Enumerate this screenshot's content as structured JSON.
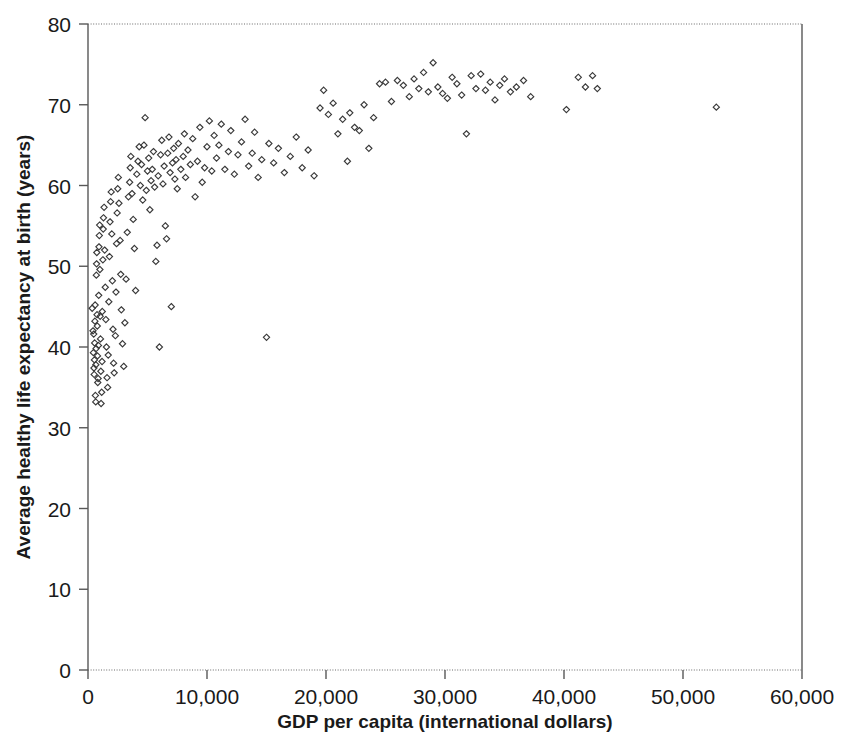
{
  "chart_data": {
    "type": "scatter",
    "title": "",
    "xlabel": "GDP per capita (international dollars)",
    "ylabel": "Average healthy life expectancy at birth (years)",
    "xlim": [
      0,
      60000
    ],
    "ylim": [
      0,
      80
    ],
    "xticks": [
      0,
      10000,
      20000,
      30000,
      40000,
      50000,
      60000
    ],
    "xtick_labels": [
      "0",
      "10,000",
      "20,000",
      "30,000",
      "40,000",
      "50,000",
      "60,000"
    ],
    "yticks": [
      0,
      10,
      20,
      30,
      40,
      50,
      60,
      70,
      80
    ],
    "ytick_labels": [
      "0",
      "10",
      "20",
      "30",
      "40",
      "50",
      "60",
      "70",
      "80"
    ],
    "grid": false,
    "legend": "none",
    "marker": "open-diamond",
    "marker_color": "#3a3a3a",
    "marker_size": 5,
    "series": [
      {
        "name": "Countries",
        "points": [
          [
            350,
            44.8
          ],
          [
            420,
            42.0
          ],
          [
            450,
            39.3
          ],
          [
            480,
            41.6
          ],
          [
            500,
            37.4
          ],
          [
            520,
            36.6
          ],
          [
            540,
            38.4
          ],
          [
            560,
            40.5
          ],
          [
            580,
            43.2
          ],
          [
            600,
            45.2
          ],
          [
            620,
            34.0
          ],
          [
            650,
            33.2
          ],
          [
            660,
            37.8
          ],
          [
            680,
            39.8
          ],
          [
            700,
            48.9
          ],
          [
            720,
            50.3
          ],
          [
            740,
            51.7
          ],
          [
            760,
            44.0
          ],
          [
            780,
            42.6
          ],
          [
            800,
            38.9
          ],
          [
            820,
            35.6
          ],
          [
            850,
            36.1
          ],
          [
            880,
            40.2
          ],
          [
            900,
            46.4
          ],
          [
            920,
            52.4
          ],
          [
            950,
            53.8
          ],
          [
            980,
            55.1
          ],
          [
            1000,
            49.6
          ],
          [
            1020,
            43.8
          ],
          [
            1050,
            41.0
          ],
          [
            1080,
            37.0
          ],
          [
            1100,
            33.0
          ],
          [
            1150,
            34.4
          ],
          [
            1180,
            38.2
          ],
          [
            1200,
            44.4
          ],
          [
            1250,
            50.8
          ],
          [
            1280,
            54.6
          ],
          [
            1300,
            56.0
          ],
          [
            1350,
            57.3
          ],
          [
            1400,
            52.0
          ],
          [
            1450,
            47.4
          ],
          [
            1500,
            43.4
          ],
          [
            1550,
            40.0
          ],
          [
            1600,
            36.2
          ],
          [
            1650,
            35.0
          ],
          [
            1700,
            39.0
          ],
          [
            1750,
            45.6
          ],
          [
            1800,
            51.2
          ],
          [
            1850,
            55.5
          ],
          [
            1900,
            58.0
          ],
          [
            1950,
            59.2
          ],
          [
            2000,
            54.0
          ],
          [
            2050,
            48.2
          ],
          [
            2100,
            42.2
          ],
          [
            2150,
            38.0
          ],
          [
            2200,
            36.8
          ],
          [
            2300,
            41.4
          ],
          [
            2350,
            46.8
          ],
          [
            2400,
            52.8
          ],
          [
            2450,
            56.6
          ],
          [
            2500,
            59.6
          ],
          [
            2550,
            61.0
          ],
          [
            2600,
            57.8
          ],
          [
            2700,
            53.2
          ],
          [
            2750,
            49.0
          ],
          [
            2800,
            44.6
          ],
          [
            2900,
            40.4
          ],
          [
            3000,
            37.6
          ],
          [
            3100,
            43.0
          ],
          [
            3200,
            48.4
          ],
          [
            3300,
            54.2
          ],
          [
            3400,
            58.6
          ],
          [
            3500,
            60.4
          ],
          [
            3550,
            62.2
          ],
          [
            3600,
            63.6
          ],
          [
            3700,
            59.0
          ],
          [
            3800,
            55.8
          ],
          [
            3900,
            52.2
          ],
          [
            4000,
            47.0
          ],
          [
            4100,
            61.4
          ],
          [
            4200,
            63.0
          ],
          [
            4300,
            64.8
          ],
          [
            4400,
            60.0
          ],
          [
            4500,
            62.6
          ],
          [
            4600,
            58.2
          ],
          [
            4700,
            65.0
          ],
          [
            4800,
            68.4
          ],
          [
            4900,
            59.4
          ],
          [
            5000,
            61.8
          ],
          [
            5100,
            63.4
          ],
          [
            5200,
            57.0
          ],
          [
            5300,
            60.6
          ],
          [
            5400,
            62.0
          ],
          [
            5500,
            64.2
          ],
          [
            5600,
            59.8
          ],
          [
            5700,
            50.6
          ],
          [
            5800,
            52.6
          ],
          [
            5900,
            61.2
          ],
          [
            6000,
            40.0
          ],
          [
            6100,
            63.8
          ],
          [
            6200,
            65.6
          ],
          [
            6300,
            60.2
          ],
          [
            6400,
            62.4
          ],
          [
            6500,
            55.0
          ],
          [
            6600,
            53.4
          ],
          [
            6700,
            64.0
          ],
          [
            6800,
            66.0
          ],
          [
            6900,
            61.6
          ],
          [
            7000,
            45.0
          ],
          [
            7100,
            62.8
          ],
          [
            7200,
            64.6
          ],
          [
            7300,
            60.8
          ],
          [
            7400,
            63.2
          ],
          [
            7500,
            59.6
          ],
          [
            7600,
            65.2
          ],
          [
            7800,
            62.0
          ],
          [
            8000,
            63.6
          ],
          [
            8100,
            66.4
          ],
          [
            8200,
            61.0
          ],
          [
            8400,
            64.4
          ],
          [
            8600,
            62.6
          ],
          [
            8800,
            65.8
          ],
          [
            9000,
            58.6
          ],
          [
            9200,
            63.0
          ],
          [
            9400,
            67.2
          ],
          [
            9600,
            60.4
          ],
          [
            9800,
            62.2
          ],
          [
            10000,
            64.8
          ],
          [
            10200,
            68.0
          ],
          [
            10400,
            61.8
          ],
          [
            10600,
            66.2
          ],
          [
            10800,
            63.4
          ],
          [
            11000,
            65.0
          ],
          [
            11200,
            67.6
          ],
          [
            11500,
            62.0
          ],
          [
            11800,
            64.2
          ],
          [
            12000,
            66.8
          ],
          [
            12300,
            61.4
          ],
          [
            12600,
            63.8
          ],
          [
            12900,
            65.4
          ],
          [
            13200,
            68.2
          ],
          [
            13500,
            62.4
          ],
          [
            13800,
            64.0
          ],
          [
            14000,
            66.6
          ],
          [
            14300,
            61.0
          ],
          [
            14600,
            63.2
          ],
          [
            15000,
            41.2
          ],
          [
            15200,
            65.2
          ],
          [
            15600,
            62.8
          ],
          [
            16000,
            64.6
          ],
          [
            16500,
            61.6
          ],
          [
            17000,
            63.6
          ],
          [
            17500,
            66.0
          ],
          [
            18000,
            62.2
          ],
          [
            18500,
            64.4
          ],
          [
            19000,
            61.2
          ],
          [
            19500,
            69.6
          ],
          [
            19800,
            71.8
          ],
          [
            20200,
            68.8
          ],
          [
            20600,
            70.2
          ],
          [
            21000,
            66.4
          ],
          [
            21400,
            68.2
          ],
          [
            21800,
            63.0
          ],
          [
            22000,
            69.0
          ],
          [
            22400,
            67.2
          ],
          [
            22800,
            66.8
          ],
          [
            23200,
            70.0
          ],
          [
            23600,
            64.6
          ],
          [
            24000,
            68.4
          ],
          [
            24500,
            72.6
          ],
          [
            25000,
            72.8
          ],
          [
            25500,
            70.4
          ],
          [
            26000,
            73.0
          ],
          [
            26500,
            72.4
          ],
          [
            27000,
            71.0
          ],
          [
            27400,
            73.2
          ],
          [
            27800,
            72.0
          ],
          [
            28200,
            74.0
          ],
          [
            28600,
            71.6
          ],
          [
            29000,
            75.2
          ],
          [
            29400,
            72.2
          ],
          [
            29800,
            71.4
          ],
          [
            30200,
            70.8
          ],
          [
            30600,
            73.4
          ],
          [
            31000,
            72.6
          ],
          [
            31400,
            71.2
          ],
          [
            31800,
            66.4
          ],
          [
            32200,
            73.6
          ],
          [
            32600,
            72.0
          ],
          [
            33000,
            73.8
          ],
          [
            33400,
            71.8
          ],
          [
            33800,
            72.8
          ],
          [
            34200,
            70.6
          ],
          [
            34600,
            72.4
          ],
          [
            35000,
            73.2
          ],
          [
            35500,
            71.6
          ],
          [
            36000,
            72.2
          ],
          [
            36600,
            73.0
          ],
          [
            37200,
            71.0
          ],
          [
            40200,
            69.4
          ],
          [
            41200,
            73.4
          ],
          [
            41800,
            72.2
          ],
          [
            42400,
            73.6
          ],
          [
            42800,
            72.0
          ],
          [
            52800,
            69.7
          ]
        ]
      }
    ]
  },
  "axis": {
    "x_title": "GDP per capita (international dollars)",
    "y_title": "Average healthy life expectancy at birth (years)"
  }
}
